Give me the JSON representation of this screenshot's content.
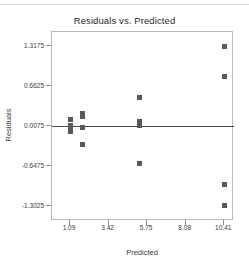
{
  "chart_data": {
    "type": "scatter",
    "title": "Residuals vs. Predicted",
    "xlabel": "Predicted",
    "ylabel": "Residuals",
    "xlim": [
      0.0,
      11.0
    ],
    "ylim": [
      -1.55,
      1.55
    ],
    "xticks": [
      1.09,
      3.42,
      5.75,
      8.08,
      10.41
    ],
    "xtick_labels": [
      "1.09",
      "3.42",
      "5.75",
      "8.08",
      "10.41"
    ],
    "yticks": [
      1.3175,
      0.6625,
      0.0075,
      -0.6475,
      -1.3025
    ],
    "ytick_labels": [
      "1.3175",
      "0.6625",
      "0.0075",
      "-0.6475",
      "-1.3025"
    ],
    "grid": false,
    "legend": null,
    "reference_line": {
      "orientation": "horizontal",
      "y": 0.0075,
      "color": "#4a4a4a"
    },
    "marker": {
      "shape": "square",
      "size": 5,
      "color": "#595959"
    },
    "points": [
      {
        "x": 1.09,
        "y": 0.11
      },
      {
        "x": 1.09,
        "y": 0.02
      },
      {
        "x": 1.09,
        "y": -0.02
      },
      {
        "x": 1.09,
        "y": -0.09
      },
      {
        "x": 1.85,
        "y": 0.22
      },
      {
        "x": 1.85,
        "y": 0.16
      },
      {
        "x": 1.85,
        "y": -0.02
      },
      {
        "x": 1.85,
        "y": -0.3
      },
      {
        "x": 5.3,
        "y": 0.48
      },
      {
        "x": 5.3,
        "y": 0.08
      },
      {
        "x": 5.3,
        "y": 0.02
      },
      {
        "x": 5.3,
        "y": -0.6
      },
      {
        "x": 10.41,
        "y": 1.32
      },
      {
        "x": 10.41,
        "y": 0.82
      },
      {
        "x": 10.41,
        "y": -0.95
      },
      {
        "x": 10.41,
        "y": -1.3
      }
    ]
  },
  "window": {
    "title_bar_present": true
  }
}
